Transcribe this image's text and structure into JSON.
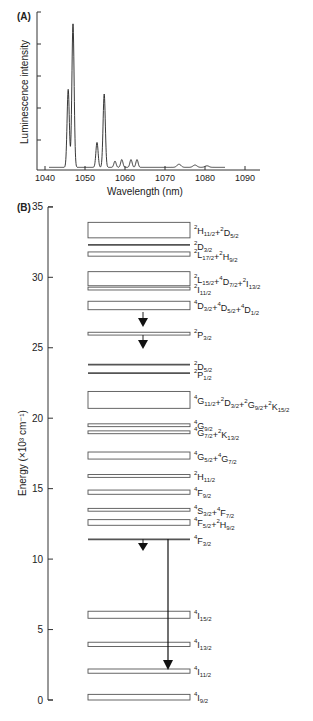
{
  "panel_a": {
    "label": "(A)",
    "xlabel": "Wavelength (nm)",
    "ylabel": "Luminescence intensity",
    "x_ticks": [
      "1040",
      "1050",
      "1060",
      "1070",
      "1080",
      "1090"
    ]
  },
  "panel_b": {
    "label": "(B)",
    "ylabel": "Energy (×10³ cm⁻¹)",
    "y_ticks": [
      "0",
      "5",
      "10",
      "15",
      "20",
      "25",
      "30",
      "35"
    ]
  },
  "chart_data": [
    {
      "type": "line",
      "title": "(A)",
      "xlabel": "Wavelength (nm)",
      "ylabel": "Luminescence intensity",
      "xlim": [
        1040,
        1090
      ],
      "ylim": [
        0,
        1
      ],
      "x_ticks": [
        1040,
        1050,
        1060,
        1070,
        1080,
        1090
      ],
      "grid": false,
      "series": [
        {
          "name": "Nd3+ 4F3/2 -> 4I11/2 emission",
          "peaks": [
            {
              "x": 1045.8,
              "y": 0.5
            },
            {
              "x": 1047.0,
              "y": 0.92
            },
            {
              "x": 1053.0,
              "y": 0.16
            },
            {
              "x": 1054.8,
              "y": 0.47
            },
            {
              "x": 1057.5,
              "y": 0.04
            },
            {
              "x": 1059.2,
              "y": 0.05
            },
            {
              "x": 1061.5,
              "y": 0.05
            },
            {
              "x": 1063.0,
              "y": 0.05
            },
            {
              "x": 1073.5,
              "y": 0.02
            },
            {
              "x": 1077.5,
              "y": 0.015
            },
            {
              "x": 1080.5,
              "y": 0.01
            }
          ]
        }
      ]
    },
    {
      "type": "energy-level-diagram",
      "title": "(B)",
      "ylabel": "Energy (×10³ cm⁻¹)",
      "ylim": [
        0,
        35
      ],
      "y_ticks": [
        0,
        5,
        10,
        15,
        20,
        25,
        30,
        35
      ],
      "levels": [
        {
          "label": "2H11/2+2D5/2",
          "e_low": 32.8,
          "e_high": 33.9
        },
        {
          "label": "2D3/2",
          "e_low": 32.3,
          "e_high": 32.3
        },
        {
          "label": "2L17/2+2H9/2",
          "e_low": 31.5,
          "e_high": 31.8
        },
        {
          "label": "2L15/2+4D7/2+2I13/2",
          "e_low": 29.4,
          "e_high": 30.4
        },
        {
          "label": "2I11/2",
          "e_low": 29.1,
          "e_high": 29.3
        },
        {
          "label": "4D3/2+4D5/2+4D1/2",
          "e_low": 27.7,
          "e_high": 28.3
        },
        {
          "label": "2P3/2",
          "e_low": 25.9,
          "e_high": 26.1
        },
        {
          "label": "2D5/2",
          "e_low": 23.7,
          "e_high": 23.8
        },
        {
          "label": "2P1/2",
          "e_low": 23.1,
          "e_high": 23.2
        },
        {
          "label": "4G11/2+2D3/2+2G9/2+2K15/2",
          "e_low": 20.7,
          "e_high": 21.9
        },
        {
          "label": "4G9/2",
          "e_low": 19.4,
          "e_high": 19.6
        },
        {
          "label": "4G7/2+2K13/2",
          "e_low": 18.9,
          "e_high": 19.1
        },
        {
          "label": "4G5/2+4G7/2",
          "e_low": 17.1,
          "e_high": 17.6
        },
        {
          "label": "2H11/2",
          "e_low": 15.8,
          "e_high": 16.0
        },
        {
          "label": "4F9/2",
          "e_low": 14.6,
          "e_high": 14.9
        },
        {
          "label": "4S3/2+4F7/2",
          "e_low": 13.4,
          "e_high": 13.6
        },
        {
          "label": "4F5/2+2H9/2",
          "e_low": 12.4,
          "e_high": 12.8
        },
        {
          "label": "4F3/2",
          "e_low": 11.4,
          "e_high": 11.4
        },
        {
          "label": "4I15/2",
          "e_low": 5.8,
          "e_high": 6.3
        },
        {
          "label": "4I13/2",
          "e_low": 3.8,
          "e_high": 4.1
        },
        {
          "label": "4I11/2",
          "e_low": 1.9,
          "e_high": 2.2
        },
        {
          "label": "4I9/2",
          "e_low": 0.0,
          "e_high": 0.4
        }
      ],
      "transitions": [
        {
          "from": "4D3/2+4D5/2+4D1/2",
          "to": "2P3/2",
          "type": "nonradiative"
        },
        {
          "from": "2P3/2",
          "to": "2D5/2",
          "type": "nonradiative"
        },
        {
          "from": "4F3/2",
          "to": "below 4F3/2",
          "type": "nonradiative"
        },
        {
          "from": "4F3/2",
          "to": "4I11/2",
          "type": "radiative"
        }
      ]
    }
  ],
  "level_labels": [
    {
      "parts": [
        [
          "2",
          "H",
          "11/2"
        ],
        [
          "2",
          "D",
          "5/2"
        ]
      ]
    },
    {
      "parts": [
        [
          "2",
          "D",
          "3/2"
        ]
      ]
    },
    {
      "parts": [
        [
          "2",
          "L",
          "17/2"
        ],
        [
          "2",
          "H",
          "9/2"
        ]
      ]
    },
    {
      "parts": [
        [
          "2",
          "L",
          "15/2"
        ],
        [
          "4",
          "D",
          "7/2"
        ],
        [
          "2",
          "I",
          "13/2"
        ]
      ]
    },
    {
      "parts": [
        [
          "2",
          "I",
          "11/2"
        ]
      ]
    },
    {
      "parts": [
        [
          "4",
          "D",
          "3/2"
        ],
        [
          "4",
          "D",
          "5/2"
        ],
        [
          "4",
          "D",
          "1/2"
        ]
      ]
    },
    {
      "parts": [
        [
          "2",
          "P",
          "3/2"
        ]
      ]
    },
    {
      "parts": [
        [
          "2",
          "D",
          "5/2"
        ]
      ]
    },
    {
      "parts": [
        [
          "2",
          "P",
          "1/2"
        ]
      ]
    },
    {
      "parts": [
        [
          "4",
          "G",
          "11/2"
        ],
        [
          "2",
          "D",
          "3/2"
        ],
        [
          "2",
          "G",
          "9/2"
        ],
        [
          "2",
          "K",
          "15/2"
        ]
      ]
    },
    {
      "parts": [
        [
          "4",
          "G",
          "9/2"
        ]
      ]
    },
    {
      "parts": [
        [
          "4",
          "G",
          "7/2"
        ],
        [
          "2",
          "K",
          "13/2"
        ]
      ]
    },
    {
      "parts": [
        [
          "4",
          "G",
          "5/2"
        ],
        [
          "4",
          "G",
          "7/2"
        ]
      ]
    },
    {
      "parts": [
        [
          "2",
          "H",
          "11/2"
        ]
      ]
    },
    {
      "parts": [
        [
          "4",
          "F",
          "9/2"
        ]
      ]
    },
    {
      "parts": [
        [
          "4",
          "S",
          "3/2"
        ],
        [
          "4",
          "F",
          "7/2"
        ]
      ]
    },
    {
      "parts": [
        [
          "4",
          "F",
          "5/2"
        ],
        [
          "2",
          "H",
          "9/2"
        ]
      ]
    },
    {
      "parts": [
        [
          "4",
          "F",
          "3/2"
        ]
      ]
    },
    {
      "parts": [
        [
          "4",
          "I",
          "15/2"
        ]
      ]
    },
    {
      "parts": [
        [
          "4",
          "I",
          "13/2"
        ]
      ]
    },
    {
      "parts": [
        [
          "4",
          "I",
          "11/2"
        ]
      ]
    },
    {
      "parts": [
        [
          "4",
          "I",
          "9/2"
        ]
      ]
    }
  ]
}
